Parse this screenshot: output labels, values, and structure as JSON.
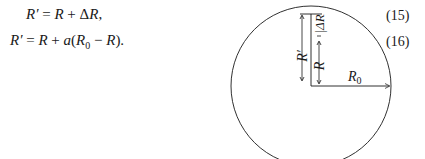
{
  "equations": [
    {
      "lhs": "R′",
      "rhs_parts": [
        "R",
        " + ",
        "ΔR",
        ","
      ],
      "number": "(15)"
    },
    {
      "lhs": "R′",
      "rhs_parts": [
        "R",
        " + ",
        "a",
        "(",
        "R",
        "0",
        " − ",
        "R",
        ")."
      ],
      "number": "(16)"
    }
  ],
  "figure": {
    "shape": "circle",
    "labels": {
      "r_prime": "R′",
      "r": "R",
      "delta_r": "|ΔR",
      "r0": "R",
      "r0_sub": "0"
    }
  }
}
